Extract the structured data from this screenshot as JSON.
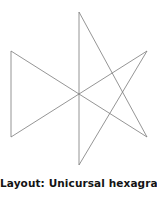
{
  "figure": {
    "caption": "Layout: Unicursal hexagram",
    "background_color": "#ffffff",
    "stroke_color": "#7a7a7a",
    "stroke_width": 0.8,
    "caption_color": "#141414"
  },
  "chart_data": {
    "type": "line",
    "title": "Layout: Unicursal hexagram",
    "xlabel": "",
    "ylabel": "",
    "grid": false,
    "legend": "none",
    "xlim": [
      0,
      157
    ],
    "ylim": [
      0,
      172
    ],
    "annotations": [
      "Layout: Unicursal hexagram"
    ],
    "vertex_labels": [
      "top",
      "upper-left",
      "upper-right",
      "lower-left",
      "lower-right",
      "bottom"
    ],
    "vertices": [
      {
        "name": "top",
        "x": 79,
        "y": 12
      },
      {
        "name": "upper-left",
        "x": 11,
        "y": 51
      },
      {
        "name": "upper-right",
        "x": 147,
        "y": 51
      },
      {
        "name": "lower-left",
        "x": 11,
        "y": 137
      },
      {
        "name": "lower-right",
        "x": 147,
        "y": 137
      },
      {
        "name": "bottom",
        "x": 79,
        "y": 165
      }
    ],
    "series": [
      {
        "name": "unicursal-path",
        "closed": true,
        "path_order": [
          "top",
          "lower-right",
          "upper-left",
          "lower-left",
          "upper-right",
          "bottom",
          "top"
        ],
        "x": [
          79,
          147,
          11,
          11,
          147,
          79,
          79
        ],
        "y": [
          12,
          137,
          51,
          137,
          51,
          165,
          12
        ]
      }
    ]
  }
}
